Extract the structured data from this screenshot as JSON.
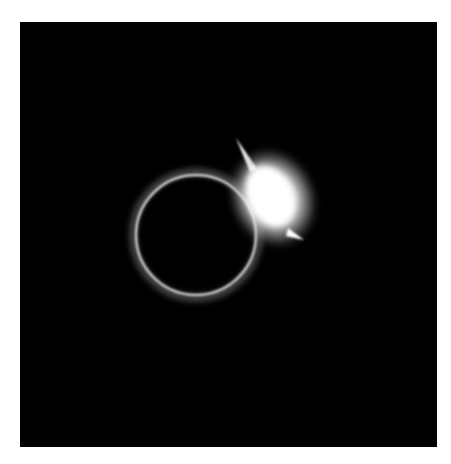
{
  "image": {
    "subject": "total solar eclipse diamond ring",
    "background_color": "#000000",
    "border_color": "#ffffff",
    "ring": {
      "cx": 196,
      "cy": 235,
      "r": 60,
      "color": "#cfcfcf"
    },
    "flare": {
      "cx": 272,
      "cy": 198,
      "color": "#ffffff"
    }
  }
}
